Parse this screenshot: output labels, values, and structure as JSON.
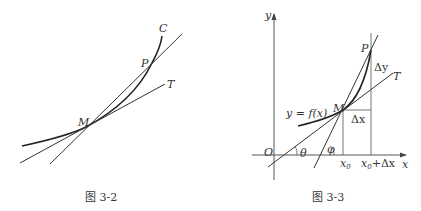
{
  "figure_left": {
    "caption": "图 3-2",
    "labels": {
      "curve": "C",
      "secant_point": "P",
      "tangent": "T",
      "point": "M"
    }
  },
  "figure_right": {
    "caption": "图 3-3",
    "labels": {
      "y_axis": "y",
      "x_axis": "x",
      "origin": "O",
      "function": "y = f(x)",
      "point_m": "M",
      "point_p": "P",
      "tangent": "T",
      "delta_x": "Δx",
      "delta_y": "Δy",
      "x0": "x",
      "x0_sub": "0",
      "x0_dx": "x",
      "x0_dx_sub": "0",
      "x0_dx_tail": "+Δx",
      "theta": "θ",
      "phi": "φ"
    }
  }
}
